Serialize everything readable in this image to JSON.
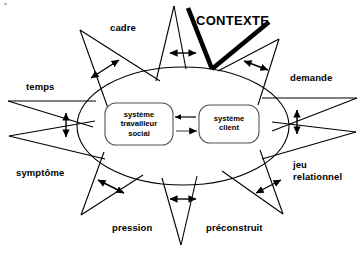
{
  "figure": {
    "title_label": "CONTEXTE",
    "accent_color": "#000000",
    "background_color": "#ffffff",
    "line_color": "#000000"
  },
  "center": {
    "boxes": [
      {
        "id": "systeme-travailleur-social",
        "label": "système\ntravailleur\nsocial"
      },
      {
        "id": "systeme-client",
        "label": "système\nclient"
      }
    ],
    "arrows": [
      {
        "id": "client-to-worker",
        "direction": "left"
      },
      {
        "id": "worker-to-client",
        "direction": "right"
      }
    ]
  },
  "spokes": [
    {
      "id": "cadre",
      "label": "cadre",
      "position": "top-left"
    },
    {
      "id": "contexte",
      "label": "CONTEXTE",
      "position": "top"
    },
    {
      "id": "demande",
      "label": "demande",
      "position": "right-top"
    },
    {
      "id": "jeu-relationnel",
      "label": "jeu\nrelationnel",
      "position": "right-bottom"
    },
    {
      "id": "preconstruit",
      "label": "préconstruit",
      "position": "bottom-right"
    },
    {
      "id": "pression",
      "label": "pression",
      "position": "bottom-left"
    },
    {
      "id": "symptome",
      "label": "symptôme",
      "position": "left-bottom"
    },
    {
      "id": "temps",
      "label": "temps",
      "position": "left-top"
    }
  ],
  "labels": {
    "cadre": "cadre",
    "temps": "temps",
    "symptome": "symptôme",
    "pression": "pression",
    "preconstruit": "préconstruit",
    "jeu_relationnel_line1": "jeu",
    "jeu_relationnel_line2": "relationnel",
    "demande": "demande",
    "contexte": "CONTEXTE"
  },
  "box_labels": {
    "worker": "système\ntravailleur\nsocial",
    "client": "système\nclient"
  }
}
